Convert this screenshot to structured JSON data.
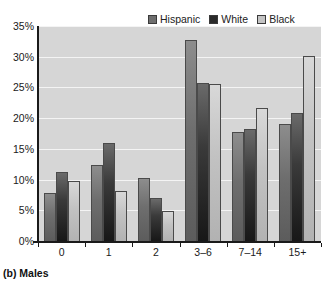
{
  "caption": "(b) Males",
  "legend": {
    "position": "top-right",
    "items": [
      {
        "label": "Hispanic",
        "color": "#6e6e6e"
      },
      {
        "label": "White",
        "color": "#2a2a2a"
      },
      {
        "label": "Black",
        "color": "#c4c4c4"
      }
    ]
  },
  "axes": {
    "y_ticks": [
      "0%",
      "5%",
      "10%",
      "15%",
      "20%",
      "25%",
      "30%",
      "35%"
    ],
    "x_ticks": [
      "0",
      "1",
      "2",
      "3–6",
      "7–14",
      "15+"
    ]
  },
  "colors": {
    "plot_background": "#d6d6d6",
    "gridline": "#f4f4f4",
    "axis": "#1a1a1a",
    "hispanic": "#6e6e6e",
    "white": "#2a2a2a",
    "black": "#c4c4c4"
  },
  "chart_data": {
    "type": "bar",
    "title": "",
    "subtitle": "",
    "xlabel": "",
    "ylabel": "",
    "ylim": [
      0,
      35
    ],
    "ytick_values": [
      0,
      5,
      10,
      15,
      20,
      25,
      30,
      35
    ],
    "grid": true,
    "legend_position": "top-right",
    "categories": [
      "0",
      "1",
      "2",
      "3–6",
      "7–14",
      "15+"
    ],
    "series": [
      {
        "name": "Hispanic",
        "color": "#6e6e6e",
        "values": [
          7.8,
          12.4,
          10.2,
          32.7,
          17.8,
          19.1
        ]
      },
      {
        "name": "White",
        "color": "#2a2a2a",
        "values": [
          11.2,
          16.0,
          7.0,
          25.7,
          18.3,
          20.9
        ]
      },
      {
        "name": "Black",
        "color": "#c4c4c4",
        "values": [
          9.7,
          8.2,
          4.9,
          25.5,
          21.6,
          30.2
        ]
      }
    ]
  }
}
